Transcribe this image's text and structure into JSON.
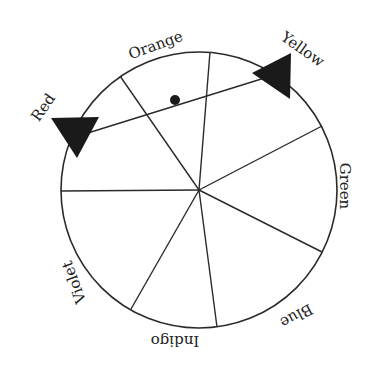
{
  "diagram": {
    "type": "color-wheel",
    "circle": {
      "cx": 199,
      "cy": 190,
      "r": 138
    },
    "stroke_color": "#2a2a2a",
    "fill_color": "#1a1a1a",
    "spokes": [
      {
        "id": "top",
        "x2": 210,
        "y2": 52
      },
      {
        "id": "upper-left",
        "x2": 120,
        "y2": 76
      },
      {
        "id": "left",
        "x2": 61,
        "y2": 191
      },
      {
        "id": "lower-left",
        "x2": 131,
        "y2": 309
      },
      {
        "id": "bottom",
        "x2": 217,
        "y2": 327
      },
      {
        "id": "lower-right",
        "x2": 322,
        "y2": 252
      },
      {
        "id": "upper-right",
        "x2": 322,
        "y2": 126
      }
    ],
    "labels": [
      {
        "text": "Orange",
        "x": 156,
        "y": 46,
        "rotate": -20
      },
      {
        "text": "Yellow",
        "x": 302,
        "y": 50,
        "rotate": 35
      },
      {
        "text": "Green",
        "x": 344,
        "y": 186,
        "rotate": 90
      },
      {
        "text": "Blue",
        "x": 296,
        "y": 315,
        "rotate": 152
      },
      {
        "text": "Indigo",
        "x": 175,
        "y": 340,
        "rotate": 180
      },
      {
        "text": "Violet",
        "x": 75,
        "y": 282,
        "rotate": -110
      },
      {
        "text": "Red",
        "x": 44,
        "y": 108,
        "rotate": -55
      }
    ],
    "pointer": {
      "line": {
        "x1": 75,
        "y1": 137,
        "x2": 271,
        "y2": 76
      },
      "pivot_dot": {
        "cx": 175,
        "cy": 100,
        "r": 5
      },
      "arrow_red": "51,118 99,117 77,158",
      "arrow_yellow": "252,73 291,53 290,99",
      "ends": [
        "Red",
        "Yellow"
      ]
    }
  }
}
